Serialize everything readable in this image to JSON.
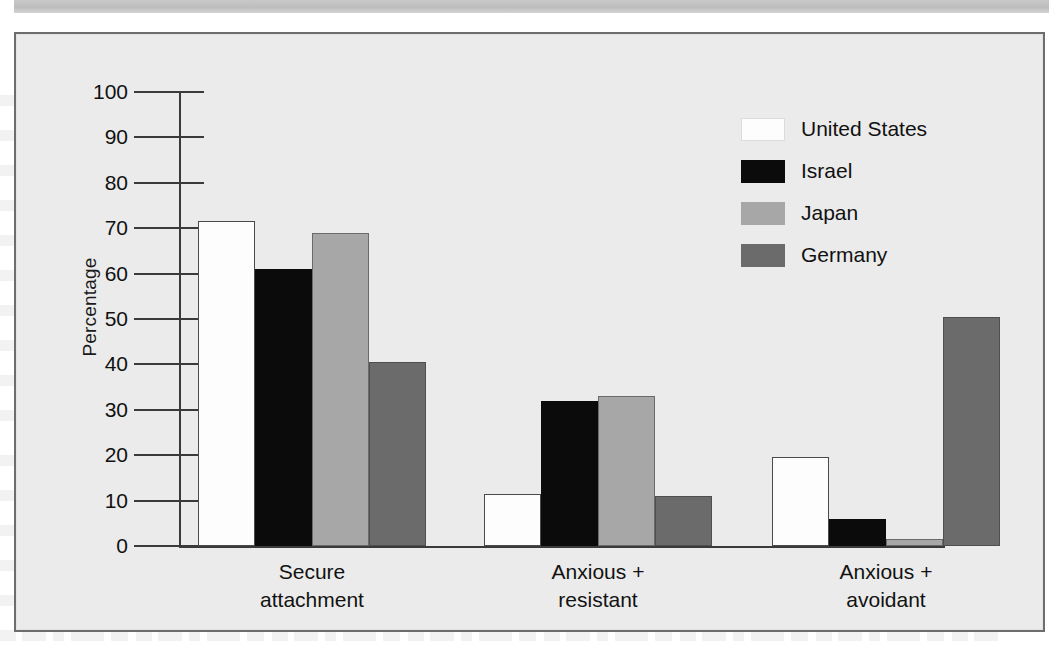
{
  "figure": {
    "background_color": "#ebebeb",
    "frame_color": "#6d6d6d",
    "scan_band": ""
  },
  "chart_data": {
    "type": "bar",
    "title": "",
    "xlabel": "",
    "ylabel": "Percentage",
    "ylim": [
      0,
      100
    ],
    "ytick_labels": [
      "100",
      "90",
      "80",
      "70",
      "60",
      "50",
      "40",
      "30",
      "20",
      "10",
      "0"
    ],
    "yticks": [
      100,
      90,
      80,
      70,
      60,
      50,
      40,
      30,
      20,
      10,
      0
    ],
    "grid": false,
    "legend_position": "upper right",
    "categories": [
      "Secure attachment",
      "Anxious + resistant",
      "Anxious + avoidant"
    ],
    "category_lines": [
      [
        "Secure",
        "attachment"
      ],
      [
        "Anxious +",
        "resistant"
      ],
      [
        "Anxious +",
        "avoidant"
      ]
    ],
    "series": [
      {
        "name": "United States",
        "color": "#fdfdfd",
        "values": [
          71.5,
          11.5,
          19.5
        ]
      },
      {
        "name": "Israel",
        "color": "#0b0b0b",
        "values": [
          61.0,
          32.0,
          6.0
        ]
      },
      {
        "name": "Japan",
        "color": "#a7a7a7",
        "values": [
          69.0,
          33.0,
          1.5
        ]
      },
      {
        "name": "Germany",
        "color": "#6b6b6b",
        "values": [
          40.5,
          11.0,
          50.5
        ]
      }
    ]
  }
}
